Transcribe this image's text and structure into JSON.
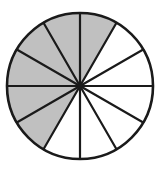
{
  "figure": {
    "background_color": "#ffffff"
  },
  "chart_data": {
    "type": "pie",
    "title": "",
    "subtitle": "",
    "xlabel": "",
    "ylabel": "",
    "legend": [],
    "annotations": [],
    "grid": false,
    "total_sectors": 12,
    "sector_angle_degrees": 30,
    "shaded_sectors": 6,
    "unshaded_sectors": 6,
    "shaded_fraction": "6/12",
    "shaded_fraction_simplified": "1/2",
    "shaded_percent": 50,
    "start_angle_degrees": 90,
    "direction": "counterclockwise",
    "geometry": {
      "center_x": 80,
      "center_y": 86,
      "radius": 73,
      "outline_width": 2.6,
      "spoke_width": 2.2
    },
    "colors": {
      "shaded_fill": "#c0c0c0",
      "unshaded_fill": "#ffffff",
      "outline": "#1a1a1a",
      "spoke": "#1a1a1a",
      "background": "#ffffff"
    },
    "categories": [
      "sector-1",
      "sector-2",
      "sector-3",
      "sector-4",
      "sector-5",
      "sector-6",
      "sector-7",
      "sector-8",
      "sector-9",
      "sector-10",
      "sector-11",
      "sector-12"
    ],
    "values": [
      30,
      30,
      30,
      30,
      30,
      30,
      30,
      30,
      30,
      30,
      30,
      30
    ],
    "sectors": [
      {
        "index": 1,
        "start_deg": 90,
        "end_deg": 120,
        "shaded": true,
        "fill": "#c0c0c0",
        "quadrant": "upper-left"
      },
      {
        "index": 2,
        "start_deg": 120,
        "end_deg": 150,
        "shaded": true,
        "fill": "#c0c0c0",
        "quadrant": "upper-left"
      },
      {
        "index": 3,
        "start_deg": 150,
        "end_deg": 180,
        "shaded": true,
        "fill": "#c0c0c0",
        "quadrant": "upper-left"
      },
      {
        "index": 4,
        "start_deg": 180,
        "end_deg": 210,
        "shaded": true,
        "fill": "#c0c0c0",
        "quadrant": "lower-left"
      },
      {
        "index": 5,
        "start_deg": 210,
        "end_deg": 240,
        "shaded": true,
        "fill": "#c0c0c0",
        "quadrant": "lower-left"
      },
      {
        "index": 6,
        "start_deg": 240,
        "end_deg": 270,
        "shaded": false,
        "fill": "#ffffff",
        "quadrant": "lower-left"
      },
      {
        "index": 7,
        "start_deg": 270,
        "end_deg": 300,
        "shaded": false,
        "fill": "#ffffff",
        "quadrant": "lower-right"
      },
      {
        "index": 8,
        "start_deg": 300,
        "end_deg": 330,
        "shaded": false,
        "fill": "#ffffff",
        "quadrant": "lower-right"
      },
      {
        "index": 9,
        "start_deg": 330,
        "end_deg": 360,
        "shaded": false,
        "fill": "#ffffff",
        "quadrant": "lower-right"
      },
      {
        "index": 10,
        "start_deg": 0,
        "end_deg": 30,
        "shaded": false,
        "fill": "#ffffff",
        "quadrant": "upper-right"
      },
      {
        "index": 11,
        "start_deg": 30,
        "end_deg": 60,
        "shaded": false,
        "fill": "#ffffff",
        "quadrant": "upper-right"
      },
      {
        "index": 12,
        "start_deg": 60,
        "end_deg": 90,
        "shaded": true,
        "fill": "#c0c0c0",
        "quadrant": "upper-right"
      }
    ]
  }
}
